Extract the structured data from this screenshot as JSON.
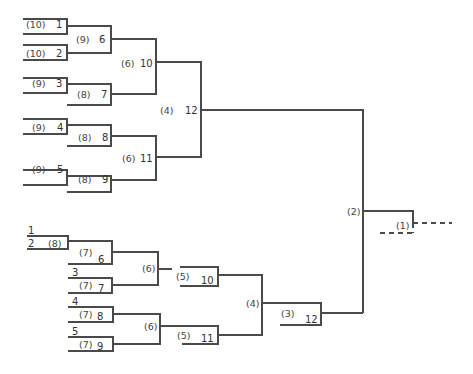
{
  "upper_bracket": {
    "first_round": [
      {
        "seed_rank": "(10)",
        "entry": "1"
      },
      {
        "seed_rank": "(10)",
        "entry": "2"
      },
      {
        "seed_rank": "(9)",
        "entry": "3"
      },
      {
        "seed_rank": "(9)",
        "entry": "4"
      },
      {
        "seed_rank": "(9)",
        "entry": "5"
      }
    ],
    "matches": [
      {
        "rank": "(9)",
        "id": "6"
      },
      {
        "rank": "(8)",
        "id": "7"
      },
      {
        "rank": "(8)",
        "id": "8"
      },
      {
        "rank": "(8)",
        "id": "9"
      },
      {
        "rank": "(6)",
        "id": "10"
      },
      {
        "rank": "(6)",
        "id": "11"
      },
      {
        "rank": "(4)",
        "id": "12"
      }
    ]
  },
  "lower_bracket": {
    "entries": [
      "1",
      "2",
      "3",
      "4",
      "5"
    ],
    "entry_rank_2": "(8)",
    "matches": [
      {
        "rank": "(7)",
        "id": "6"
      },
      {
        "rank": "(7)",
        "id": "7"
      },
      {
        "rank": "(7)",
        "id": "8"
      },
      {
        "rank": "(7)",
        "id": "9"
      },
      {
        "rank": "(6)",
        "id": ""
      },
      {
        "rank": "(6)",
        "id": ""
      },
      {
        "rank": "(5)",
        "id": "10"
      },
      {
        "rank": "(5)",
        "id": "11"
      },
      {
        "rank": "(4)",
        "id": ""
      },
      {
        "rank": "(3)",
        "id": "12"
      }
    ]
  },
  "final": {
    "semifinal_rank": "(2)",
    "final_rank": "(1)"
  }
}
